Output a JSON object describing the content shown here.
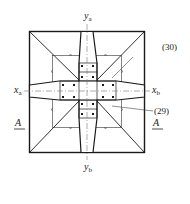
{
  "diagram": {
    "type": "structural plan view - column footing with cross-shaped steel insert",
    "axes": {
      "x_left": {
        "main": "x",
        "sub": "a"
      },
      "x_right": {
        "main": "x",
        "sub": "b"
      },
      "y_top": {
        "main": "y",
        "sub": "a"
      },
      "y_bottom": {
        "main": "y",
        "sub": "b"
      }
    },
    "callouts": [
      {
        "id": "callout-30",
        "label": "(30)"
      },
      {
        "id": "callout-29",
        "label": "(29)"
      }
    ],
    "section_marks": {
      "left": "A",
      "right": "A"
    },
    "colors": {
      "line": "#1a1a1a",
      "centerline": "#777777",
      "background": "#ffffff"
    }
  }
}
